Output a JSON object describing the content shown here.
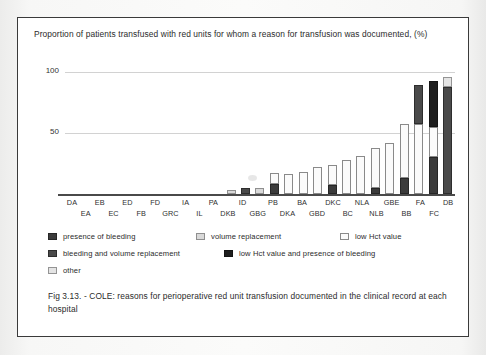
{
  "figure": {
    "title": "Proportion of patients transfused with red units for whom a reason for transfusion was documented,  (%)",
    "caption": "Fig 3.13. - COLE: reasons for perioperative red unit transfusion documented in the clinical record at each hospital"
  },
  "legend": {
    "items": [
      {
        "key": "bleed",
        "label": "presence of bleeding",
        "color": "#3b3b3b"
      },
      {
        "key": "vol",
        "label": "volume replacement",
        "color": "#d9d9d9"
      },
      {
        "key": "hct",
        "label": "low Hct value",
        "color": "#fbfbfb"
      },
      {
        "key": "bleedvol",
        "label": "bleeding and volume replacement",
        "color": "#4a4a4a"
      },
      {
        "key": "hctbleed",
        "label": "low Hct  value and presence of bleeding",
        "color": "#1e1e1e"
      },
      {
        "key": "other",
        "label": "other",
        "color": "#e4e4e4"
      }
    ]
  },
  "chart_data": {
    "type": "bar",
    "stacked": true,
    "title": "Proportion of patients transfused with red units for whom a reason for transfusion was documented,  (%)",
    "xlabel": "",
    "ylabel": "",
    "ylim": [
      0,
      100
    ],
    "yticks": [
      50,
      100
    ],
    "grid": true,
    "legend_position": "below",
    "categories": [
      "DA",
      "EA",
      "EB",
      "EC",
      "ED",
      "FB",
      "FD",
      "GRC",
      "IA",
      "IL",
      "PA",
      "DKB",
      "ID",
      "GBG",
      "PB",
      "DKA",
      "BA",
      "GBD",
      "DKC",
      "BC",
      "NLA",
      "NLB",
      "GBE",
      "BB",
      "FA",
      "FC",
      "DB"
    ],
    "series": [
      {
        "name": "presence of bleeding",
        "key": "bleed",
        "values": [
          0,
          0,
          0,
          0,
          0,
          0,
          0,
          0,
          0,
          0,
          0,
          0,
          0,
          0,
          8,
          0,
          0,
          0,
          7,
          0,
          0,
          5,
          0,
          13,
          0,
          30,
          0
        ]
      },
      {
        "name": "volume replacement",
        "key": "vol",
        "values": [
          0,
          0,
          0,
          0,
          0,
          0,
          0,
          0,
          0,
          0,
          0,
          3,
          0,
          5,
          0,
          0,
          0,
          0,
          0,
          0,
          0,
          0,
          0,
          0,
          0,
          0,
          0
        ]
      },
      {
        "name": "low Hct value",
        "key": "hct",
        "values": [
          0,
          0,
          0,
          0,
          0,
          0,
          0,
          0,
          0,
          0,
          0,
          0,
          0,
          0,
          9,
          16,
          18,
          22,
          17,
          28,
          31,
          33,
          42,
          44,
          57,
          25,
          0
        ]
      },
      {
        "name": "bleeding and volume replacement",
        "key": "bleedvol",
        "values": [
          0,
          0,
          0,
          0,
          0,
          0,
          0,
          0,
          0,
          0,
          0,
          0,
          5,
          0,
          0,
          0,
          0,
          0,
          0,
          0,
          0,
          0,
          0,
          0,
          32,
          0,
          88
        ]
      },
      {
        "name": "low Hct  value and presence of bleeding",
        "key": "hctbleed",
        "values": [
          0,
          0,
          0,
          0,
          0,
          0,
          0,
          0,
          0,
          0,
          0,
          0,
          0,
          0,
          0,
          0,
          0,
          0,
          0,
          0,
          0,
          0,
          0,
          0,
          0,
          38,
          0
        ]
      },
      {
        "name": "other",
        "key": "other",
        "values": [
          0,
          0,
          0,
          0,
          0,
          0,
          0,
          0,
          0,
          0,
          0,
          0,
          0,
          0,
          0,
          0,
          0,
          0,
          0,
          0,
          0,
          0,
          0,
          0,
          0,
          0,
          8
        ]
      }
    ],
    "totals": [
      0,
      0,
      0,
      0,
      0,
      0,
      0,
      0,
      0,
      0,
      0,
      3,
      5,
      5,
      17,
      16,
      18,
      22,
      24,
      28,
      31,
      38,
      42,
      57,
      89,
      93,
      96
    ]
  }
}
